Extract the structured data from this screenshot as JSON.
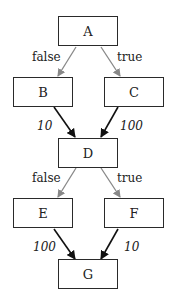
{
  "diagram": {
    "type": "control-flow-graph",
    "nodes": [
      {
        "id": "A",
        "label": "A"
      },
      {
        "id": "B",
        "label": "B"
      },
      {
        "id": "C",
        "label": "C"
      },
      {
        "id": "D",
        "label": "D"
      },
      {
        "id": "E",
        "label": "E"
      },
      {
        "id": "F",
        "label": "F"
      },
      {
        "id": "G",
        "label": "G"
      }
    ],
    "edges": [
      {
        "from": "A",
        "to": "B",
        "label": "false",
        "color": "#888888"
      },
      {
        "from": "A",
        "to": "C",
        "label": "true",
        "color": "#888888"
      },
      {
        "from": "B",
        "to": "D",
        "label": "10",
        "color": "#111111"
      },
      {
        "from": "C",
        "to": "D",
        "label": "100",
        "color": "#111111"
      },
      {
        "from": "D",
        "to": "E",
        "label": "false",
        "color": "#888888"
      },
      {
        "from": "D",
        "to": "F",
        "label": "true",
        "color": "#888888"
      },
      {
        "from": "E",
        "to": "G",
        "label": "100",
        "color": "#111111"
      },
      {
        "from": "F",
        "to": "G",
        "label": "10",
        "color": "#111111"
      }
    ]
  }
}
